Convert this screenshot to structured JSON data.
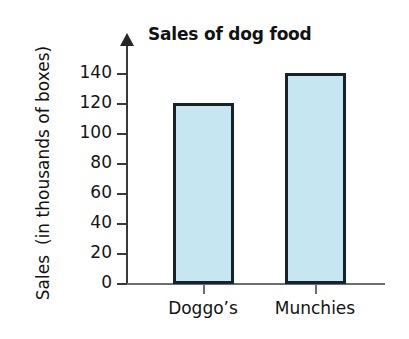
{
  "chart_data": {
    "type": "bar",
    "title": "Sales of dog food",
    "xlabel": "",
    "ylabel": "Sales (in thousands of boxes)",
    "ylabel_lines": [
      "Sales",
      "(in thousands of boxes)"
    ],
    "categories": [
      "Doggo’s",
      "Munchies"
    ],
    "values": [
      120,
      140
    ],
    "ylim": [
      0,
      140
    ],
    "yticks": [
      0,
      20,
      40,
      60,
      80,
      100,
      120,
      140
    ],
    "ytick_labels": [
      "0",
      "20",
      "40",
      "60",
      "80",
      "100",
      "120",
      "140"
    ],
    "grid": false,
    "legend": null,
    "bar_fill_color": "#c6e6f2",
    "bar_border_color": "#18222e",
    "axis_color": "#3a3a3a",
    "background_color": "#ffffff"
  }
}
